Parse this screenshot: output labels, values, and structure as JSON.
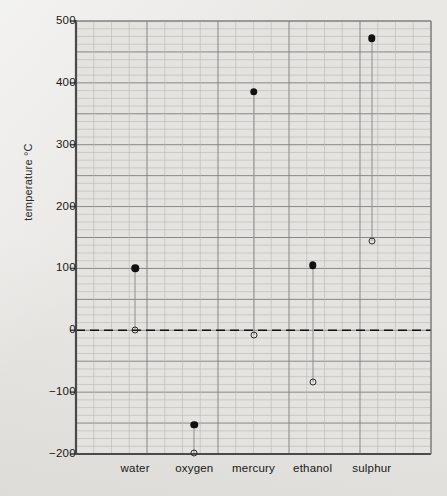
{
  "chart_data": {
    "type": "scatter",
    "title": "",
    "subtitle": "",
    "xlabel": "",
    "ylabel": "temperature °C",
    "categories": [
      "water",
      "oxygen",
      "mercury",
      "ethanol",
      "sulphur"
    ],
    "ylim": [
      -200,
      500
    ],
    "yticks": [
      500,
      400,
      300,
      200,
      100,
      0,
      -100,
      -200
    ],
    "ytick_labels": [
      "500",
      "400",
      "300",
      "200",
      "100",
      "0",
      "−100",
      "−200"
    ],
    "grid": true,
    "grid_major_step": 50,
    "grid_minor_step": 12.5,
    "legend_position": "none",
    "zero_line": {
      "value": 0,
      "style": "dashed"
    },
    "series": [
      {
        "name": "boiling point",
        "marker": "filled-circle",
        "color": "#111111",
        "values": [
          100,
          -153,
          386,
          105,
          472
        ]
      },
      {
        "name": "melting point",
        "marker": "open-circle",
        "color": "#2e2e2e",
        "values": [
          0,
          -198,
          -8,
          -83,
          145
        ]
      }
    ],
    "points": [
      {
        "category": "water",
        "boiling": 100,
        "melting": 0
      },
      {
        "category": "oxygen",
        "boiling": -153,
        "melting": -198
      },
      {
        "category": "mercury",
        "boiling": 386,
        "melting": -8
      },
      {
        "category": "ethanol",
        "boiling": 105,
        "melting": -83
      },
      {
        "category": "sulphur",
        "boiling": 472,
        "melting": 145
      }
    ],
    "colors": {
      "background": "#e9e8e5",
      "plot_background": "#e4e3df",
      "axis": "#4a4a4a",
      "grid_major": "#7d7d7d",
      "grid_minor": "#b9b8b4",
      "marker_filled": "#111111",
      "marker_open": "#2e2e2e",
      "zero_line": "#111111"
    }
  }
}
